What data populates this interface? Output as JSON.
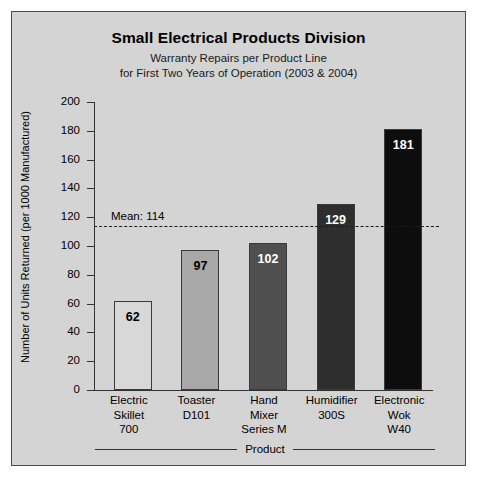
{
  "panel": {
    "background_color": "#d4d4d4",
    "border_color": "#4a4a4a"
  },
  "header": {
    "title": "Small Electrical Products Division",
    "subtitle_line1": "Warranty Repairs per Product Line",
    "subtitle_line2": "for First Two Years of Operation (2003 & 2004)"
  },
  "chart_data": {
    "type": "bar",
    "title": "Small Electrical Products Division",
    "subtitle": "Warranty Repairs per Product Line for First Two Years of Operation (2003 & 2004)",
    "xlabel": "Product",
    "ylabel": "Number of Units Returned (per 1000 Manufactured)",
    "ylim": [
      0,
      200
    ],
    "yticks": [
      0,
      20,
      40,
      60,
      80,
      100,
      120,
      140,
      160,
      180,
      200
    ],
    "ytick_labels": [
      "0",
      "20",
      "40",
      "60",
      "80",
      "100",
      "120",
      "140",
      "160",
      "180",
      "200"
    ],
    "grid": false,
    "legend": "none",
    "categories": [
      "Electric Skillet 700",
      "Toaster D101",
      "Hand Mixer Series M",
      "Humidifier 300S",
      "Electronic Wok W40"
    ],
    "category_lines": [
      [
        "Electric",
        "Skillet",
        "700"
      ],
      [
        "Toaster",
        "D101"
      ],
      [
        "Hand",
        "Mixer",
        "Series M"
      ],
      [
        "Humidifier",
        "300S"
      ],
      [
        "Electronic",
        "Wok",
        "W40"
      ]
    ],
    "values": [
      62,
      97,
      102,
      129,
      181
    ],
    "value_labels": [
      "62",
      "97",
      "102",
      "129",
      "181"
    ],
    "bar_colors": [
      "#d8d8d8",
      "#a8a8a8",
      "#4f4f4f",
      "#2e2e2e",
      "#0d0d0d"
    ],
    "bar_label_colors": [
      "#000000",
      "#000000",
      "#ffffff",
      "#ffffff",
      "#ffffff"
    ],
    "bar_border_color": "#3a3a3a",
    "annotations": [
      {
        "name": "mean-line",
        "label": "Mean: 114",
        "value": 114,
        "style": "dashed",
        "color": "#1a1a1a"
      }
    ]
  }
}
